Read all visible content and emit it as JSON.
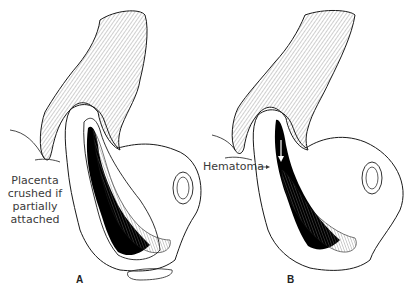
{
  "figure": {
    "panels": [
      {
        "letter": "A",
        "annotation_lines": [
          "Placenta",
          "crushed if",
          "partially",
          "attached"
        ]
      },
      {
        "letter": "B",
        "annotation": "Hematoma"
      }
    ],
    "colors": {
      "ink": "#1a1a1a",
      "fill": "#000000",
      "hatch": "#9a9a9a",
      "text": "#3a3a3a"
    }
  }
}
